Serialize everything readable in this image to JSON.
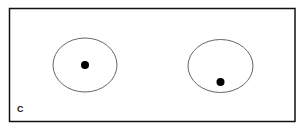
{
  "diagram": {
    "panel_label": "C",
    "frame": {
      "x": 9.5,
      "y": 8.5,
      "width": 285.5,
      "height": 113,
      "stroke": "#111111"
    },
    "circles": [
      {
        "cx": 85,
        "cy": 65,
        "rx": 32,
        "ry": 27,
        "stroke": "#666666"
      },
      {
        "cx": 220.5,
        "cy": 66,
        "rx": 32.5,
        "ry": 26.5,
        "stroke": "#666666"
      }
    ],
    "dots": [
      {
        "cx": 85,
        "cy": 65,
        "r": 4,
        "fill": "#000000"
      },
      {
        "cx": 220.5,
        "cy": 82,
        "r": 4,
        "fill": "#000000"
      }
    ]
  }
}
